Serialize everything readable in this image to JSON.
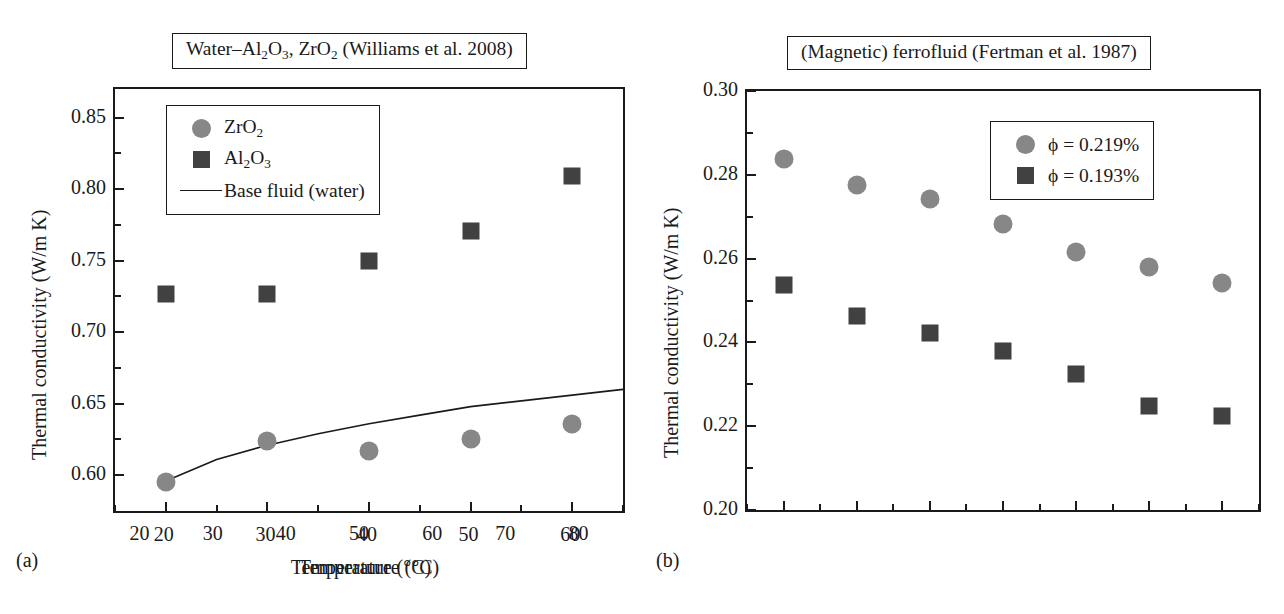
{
  "figure": {
    "panel_a_letter": "(a)",
    "panel_b_letter": "(b)"
  },
  "panel_a": {
    "title_text": "Water–Al2O3, ZrO2 (Williams et al. 2008)",
    "title_prefix": "Water–Al",
    "title_sub1": "2",
    "title_mid1": "O",
    "title_sub2": "3",
    "title_mid2": ", ZrO",
    "title_sub3": "2",
    "title_suffix": " (Williams et al. 2008)",
    "xlabel": "Temperature (°C)",
    "ylabel": "Thermal conductivity (W/m K)",
    "legend": {
      "item1_prefix": "ZrO",
      "item1_sub": "2",
      "item2_prefix": "Al",
      "item2_sub1": "2",
      "item2_mid": "O",
      "item2_sub2": "3",
      "item3": "Base fluid (water)"
    }
  },
  "panel_b": {
    "title_text": "(Magnetic) ferrofluid (Fertman et al. 1987)",
    "xlabel": "Temperature (°C)",
    "ylabel": "Thermal conductivity (W/m K)",
    "legend": {
      "item1": "ϕ = 0.219%",
      "item2": "ϕ = 0.193%"
    }
  },
  "colors": {
    "circle_marker": "#878787",
    "square_marker": "#414141",
    "axis": "#1a1a1a",
    "background": "#ffffff"
  },
  "caption_sliver": "",
  "chart_data": [
    {
      "type": "scatter",
      "panel": "(a)",
      "title": "Water–Al2O3, ZrO2 (Williams et al. 2008)",
      "xlabel": "Temperature (°C)",
      "ylabel": "Thermal conductivity (W/m K)",
      "xlim": [
        15,
        65
      ],
      "ylim": [
        0.575,
        0.87
      ],
      "xticks": [
        20,
        30,
        40,
        50,
        60
      ],
      "xticklabels": [
        "20",
        "30",
        "40",
        "50",
        "60"
      ],
      "xminorticks": [
        15,
        25,
        35,
        45,
        55,
        65
      ],
      "yticks": [
        0.6,
        0.65,
        0.7,
        0.75,
        0.8,
        0.85
      ],
      "yticklabels": [
        "0.60",
        "0.65",
        "0.70",
        "0.75",
        "0.80",
        "0.85"
      ],
      "yminorticks": [
        0.625,
        0.675,
        0.725,
        0.775,
        0.825
      ],
      "grid": false,
      "legend_position": "upper-left",
      "x": [
        20,
        30,
        40,
        50,
        60
      ],
      "series": [
        {
          "name": "ZrO2",
          "marker": "circle",
          "color": "#878787",
          "values": [
            0.595,
            0.624,
            0.617,
            0.625,
            0.636
          ]
        },
        {
          "name": "Al2O3",
          "marker": "square",
          "color": "#414141",
          "values": [
            0.727,
            0.727,
            0.75,
            0.771,
            0.809
          ]
        }
      ],
      "line_series": [
        {
          "name": "Base fluid (water)",
          "color": "#1a1a1a",
          "x": [
            20,
            25,
            30,
            35,
            40,
            45,
            50,
            55,
            60,
            65
          ],
          "values": [
            0.596,
            0.611,
            0.621,
            0.629,
            0.636,
            0.642,
            0.648,
            0.652,
            0.656,
            0.66
          ]
        }
      ]
    },
    {
      "type": "scatter",
      "panel": "(b)",
      "title": "(Magnetic) ferrofluid (Fertman et al. 1987)",
      "xlabel": "Temperature (°C)",
      "ylabel": "Thermal conductivity (W/m K)",
      "xlim": [
        15,
        85
      ],
      "ylim": [
        0.2,
        0.3
      ],
      "xticks": [
        20,
        30,
        40,
        50,
        60,
        70,
        80
      ],
      "xticklabels": [
        "20",
        "30",
        "40",
        "50",
        "60",
        "70",
        "80"
      ],
      "xminorticks": [
        15,
        25,
        35,
        45,
        55,
        65,
        75,
        85
      ],
      "yticks": [
        0.2,
        0.22,
        0.24,
        0.26,
        0.28,
        0.3
      ],
      "yticklabels": [
        "0.20",
        "0.22",
        "0.24",
        "0.26",
        "0.28",
        "0.30"
      ],
      "yminorticks": [
        0.21,
        0.23,
        0.25,
        0.27,
        0.29
      ],
      "grid": false,
      "legend_position": "upper-right",
      "x": [
        20,
        30,
        40,
        50,
        60,
        70,
        80
      ],
      "series": [
        {
          "name": "ϕ = 0.219%",
          "marker": "circle",
          "color": "#878787",
          "values": [
            0.2837,
            0.2775,
            0.2742,
            0.2683,
            0.2616,
            0.258,
            0.2541
          ]
        },
        {
          "name": "ϕ = 0.193%",
          "marker": "square",
          "color": "#414141",
          "values": [
            0.2537,
            0.2462,
            0.2422,
            0.2379,
            0.2325,
            0.2248,
            0.2225
          ]
        }
      ]
    }
  ]
}
